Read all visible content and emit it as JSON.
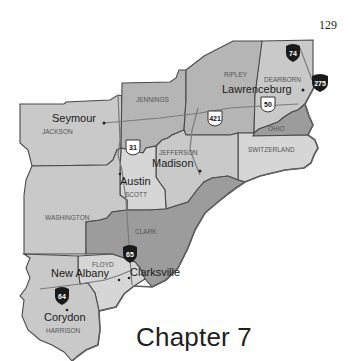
{
  "page": {
    "page_number": "129",
    "chapter_title": "Chapter 7"
  },
  "map": {
    "counties": [
      {
        "name": "JENNINGS"
      },
      {
        "name": "RIPLEY"
      },
      {
        "name": "DEARBORN"
      },
      {
        "name": "OHIO"
      },
      {
        "name": "SWITZERLAND"
      },
      {
        "name": "JEFFERSON"
      },
      {
        "name": "JACKSON"
      },
      {
        "name": "SCOTT"
      },
      {
        "name": "WASHINGTON"
      },
      {
        "name": "CLARK"
      },
      {
        "name": "FLOYD"
      },
      {
        "name": "HARRISON"
      }
    ],
    "cities": [
      {
        "name": "Seymour"
      },
      {
        "name": "Lawrenceburg"
      },
      {
        "name": "Madison"
      },
      {
        "name": "Austin"
      },
      {
        "name": "New Albany"
      },
      {
        "name": "Clarksville"
      },
      {
        "name": "Corydon"
      }
    ],
    "highways": [
      {
        "type": "interstate",
        "number": "74"
      },
      {
        "type": "interstate",
        "number": "275"
      },
      {
        "type": "us",
        "number": "50"
      },
      {
        "type": "us",
        "number": "421"
      },
      {
        "type": "us",
        "number": "31"
      },
      {
        "type": "interstate",
        "number": "65"
      },
      {
        "type": "interstate",
        "number": "64"
      }
    ],
    "colors": {
      "interstate_shield": "#1a1a1a",
      "us_shield": "#ffffff",
      "county_border": "#4a4a4a"
    }
  }
}
